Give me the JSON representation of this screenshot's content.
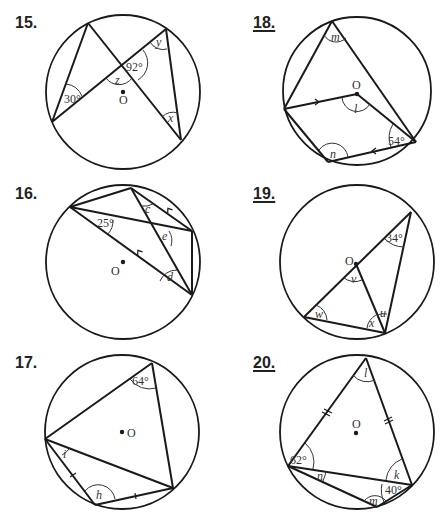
{
  "problems": [
    {
      "number": "15.",
      "underlined": false,
      "center_label": "O",
      "given_angles": [
        "30°",
        "92°"
      ],
      "unknowns": [
        "x",
        "y",
        "z"
      ]
    },
    {
      "number": "16.",
      "underlined": false,
      "center_label": "O",
      "given_angles": [
        "25°"
      ],
      "unknowns": [
        "c",
        "d",
        "e"
      ]
    },
    {
      "number": "17.",
      "underlined": false,
      "center_label": "O",
      "given_angles": [
        "64°"
      ],
      "unknowns": [
        "h",
        "i"
      ]
    },
    {
      "number": "18.",
      "underlined": true,
      "center_label": "O",
      "given_angles": [
        "54°"
      ],
      "unknowns": [
        "l",
        "m",
        "n"
      ]
    },
    {
      "number": "19.",
      "underlined": true,
      "center_label": "O",
      "given_angles": [
        "34°"
      ],
      "unknowns": [
        "u",
        "v",
        "w",
        "x"
      ]
    },
    {
      "number": "20.",
      "underlined": true,
      "center_label": "O",
      "given_angles": [
        "62°",
        "40°"
      ],
      "unknowns": [
        "k",
        "l",
        "m",
        "n"
      ]
    }
  ],
  "labels": {
    "p15": {
      "a30": "30°",
      "a92": "92°",
      "x": "x",
      "y": "y",
      "z": "z",
      "o": "O"
    },
    "p16": {
      "a25": "25°",
      "c": "c",
      "d": "d",
      "e": "e",
      "o": "O"
    },
    "p17": {
      "a64": "64°",
      "h": "h",
      "i": "i",
      "o": "O"
    },
    "p18": {
      "a54": "54°",
      "l": "l",
      "m": "m",
      "n": "n",
      "o": "O"
    },
    "p19": {
      "a34": "34°",
      "u": "u",
      "v": "v",
      "w": "w",
      "x": "x",
      "o": "O"
    },
    "p20": {
      "a62": "62°",
      "a40": "40°",
      "k": "k",
      "l": "l",
      "m": "m",
      "n": "n",
      "o": "O"
    }
  },
  "colors": {
    "ink": "#1a1a1a",
    "background": "#ffffff"
  }
}
